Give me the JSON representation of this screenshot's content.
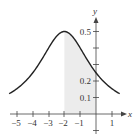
{
  "chart_data": {
    "type": "line",
    "title": "",
    "xlabel": "x",
    "ylabel": "y",
    "function_estimate": "y = 2/(x^2 + 4x + 8)",
    "xlim": [
      -5.5,
      1.5
    ],
    "ylim": [
      -0.1,
      0.55
    ],
    "x_ticks": [
      -5,
      -4,
      -3,
      -2,
      -1,
      1
    ],
    "x_tick_labels": [
      "−5",
      "−4",
      "−3",
      "−2",
      "−1",
      "1"
    ],
    "y_ticks": [
      0.1,
      0.2,
      0.3,
      0.4,
      0.5
    ],
    "y_tick_labels": [
      "0.1",
      "0.2",
      "",
      "",
      "0.5"
    ],
    "shaded_region": {
      "x_from": -2,
      "x_to": 0,
      "color": "#ececec"
    },
    "grid": false,
    "series": [
      {
        "name": "curve",
        "x": [
          -5.5,
          -5,
          -4.5,
          -4,
          -3.5,
          -3,
          -2.5,
          -2,
          -1.5,
          -1,
          -0.5,
          0,
          0.5,
          1,
          1.5
        ],
        "values": [
          0.123,
          0.154,
          0.195,
          0.25,
          0.32,
          0.4,
          0.471,
          0.5,
          0.471,
          0.4,
          0.32,
          0.25,
          0.195,
          0.154,
          0.123
        ]
      }
    ]
  },
  "labels": {
    "x_axis": "x",
    "y_axis": "y",
    "xt": [
      "−5",
      "−4",
      "−3",
      "−2",
      "−1",
      "1"
    ],
    "yt": {
      "p1": "0.1",
      "p2": "0.2",
      "p5": "0.5"
    }
  }
}
